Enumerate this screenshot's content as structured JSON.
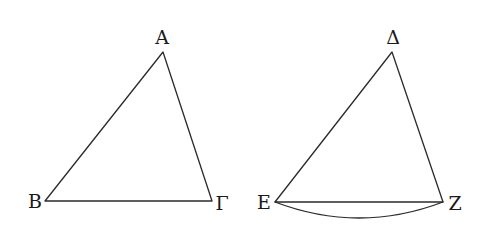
{
  "figure": {
    "width": 483,
    "height": 228,
    "stroke_color": "#2a2a2a",
    "label_color": "#1a1a1a",
    "background": "#ffffff"
  },
  "triangles": [
    {
      "name": "ABΓ",
      "vertices": {
        "apex": {
          "label": "Α",
          "x": 163,
          "y": 52
        },
        "left": {
          "label": "Β",
          "x": 45,
          "y": 201
        },
        "right": {
          "label": "Γ",
          "x": 212,
          "y": 201
        }
      },
      "label_positions": {
        "apex": {
          "x": 162,
          "y": 44
        },
        "left": {
          "x": 35,
          "y": 208
        },
        "right": {
          "x": 222,
          "y": 210
        }
      }
    },
    {
      "name": "ΔEZ",
      "vertices": {
        "apex": {
          "label": "Δ",
          "x": 392,
          "y": 52
        },
        "left": {
          "label": "Ε",
          "x": 275,
          "y": 202
        },
        "right": {
          "label": "Ζ",
          "x": 443,
          "y": 202
        }
      },
      "label_positions": {
        "apex": {
          "x": 393,
          "y": 44
        },
        "left": {
          "x": 264,
          "y": 209
        },
        "right": {
          "x": 455,
          "y": 210
        }
      },
      "arc": {
        "from": "Ε",
        "to": "Ζ",
        "control_y": 234
      }
    }
  ],
  "labels": {
    "A": "Α",
    "B": "Β",
    "Gamma": "Γ",
    "Delta": "Δ",
    "E": "Ε",
    "Z": "Ζ"
  }
}
